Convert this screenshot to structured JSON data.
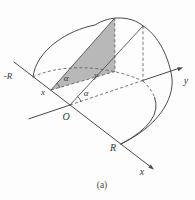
{
  "figure": {
    "caption": "(a)",
    "labels": {
      "minus_R": "-R",
      "x_point": "x",
      "alpha_section": "α",
      "y_length": "y",
      "alpha_origin": "α",
      "origin": "O",
      "y_axis": "y",
      "R_point": "R",
      "x_axis": "x"
    },
    "colors": {
      "line": "#4a4a4a",
      "dashed_line": "#5d5d5d",
      "section_fill": "#aeaeae",
      "background": "#fdfdfd"
    }
  }
}
